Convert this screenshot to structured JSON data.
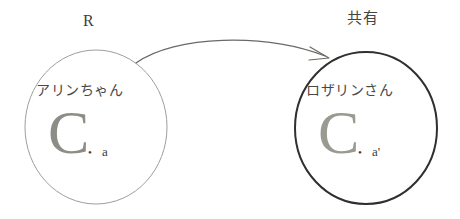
{
  "diagram": {
    "type": "concept-diagram",
    "background_color": "#ffffff",
    "relation": {
      "label": "R",
      "arrow_direction": "left-to-right",
      "arrow_style": "curved-arc-with-arrowhead",
      "arrow_color": "#6a6a64"
    },
    "right_annotation": {
      "label": "共有"
    },
    "nodes": [
      {
        "id": "left",
        "name": "アリンちゃん",
        "circle_color": "#9e9e98",
        "circle_stroke_width": "1",
        "glyph": "C",
        "item_label": "a",
        "dot": "•"
      },
      {
        "id": "right",
        "name": "ロザリンさん",
        "circle_color": "#2f2f2c",
        "circle_stroke_width": "2",
        "glyph": "C",
        "item_label": "a'",
        "dot": "•"
      }
    ]
  }
}
